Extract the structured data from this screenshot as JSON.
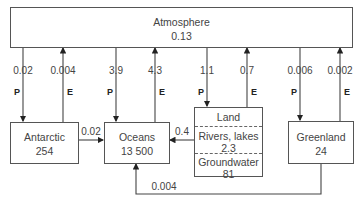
{
  "atmosphere": {
    "name": "Atmosphere",
    "value": "0.13"
  },
  "reservoirs": {
    "antarctic": {
      "name": "Antarctic",
      "value": "254"
    },
    "oceans": {
      "name": "Oceans",
      "value": "13 500"
    },
    "land": {
      "name": "Land",
      "rivers_lakes": "Rivers, lakes",
      "rivers_value": "2.3",
      "groundwater": "Groundwater",
      "groundwater_value": "81"
    },
    "greenland": {
      "name": "Greenland",
      "value": "24"
    }
  },
  "fluxes": [
    {
      "label": "0.02",
      "type": "P",
      "from": "Atmosphere",
      "to": "Antarctic"
    },
    {
      "label": "0.004",
      "type": "E",
      "from": "Antarctic",
      "to": "Atmosphere"
    },
    {
      "label": "3.9",
      "type": "P",
      "from": "Atmosphere",
      "to": "Oceans"
    },
    {
      "label": "4.3",
      "type": "E",
      "from": "Oceans",
      "to": "Atmosphere"
    },
    {
      "label": "1.1",
      "type": "P",
      "from": "Atmosphere",
      "to": "Land"
    },
    {
      "label": "0.7",
      "type": "E",
      "from": "Land",
      "to": "Atmosphere"
    },
    {
      "label": "0.006",
      "type": "P",
      "from": "Atmosphere",
      "to": "Greenland"
    },
    {
      "label": "0.002",
      "type": "E",
      "from": "Greenland",
      "to": "Atmosphere"
    }
  ],
  "lateral_flows": {
    "antarctic_to_oceans": "0.02",
    "land_to_oceans": "0.4",
    "greenland_to_oceans": "0.004"
  },
  "flux_type_labels": {
    "P": "P",
    "E": "E"
  }
}
